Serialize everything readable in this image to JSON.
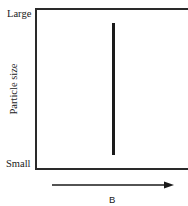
{
  "diagram": {
    "y_axis": {
      "title": "Particle size",
      "top_label": "Large",
      "bottom_label": "Small"
    },
    "x_axis": {
      "title": "B",
      "arrow_direction": "right"
    },
    "series": {
      "type": "vertical-line",
      "description": "Particle size spans full range independent of B",
      "color": "#1a1a1a"
    },
    "axis_color": "#2a2a2a"
  }
}
